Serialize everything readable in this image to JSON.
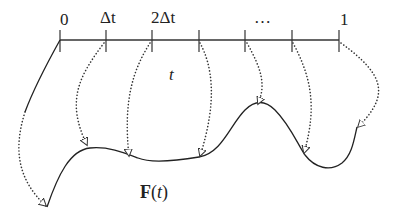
{
  "diagram": {
    "type": "parameter-interval-to-curve mapping",
    "axis": {
      "tick_labels": [
        "0",
        "Δt",
        "2Δt",
        "…",
        "1"
      ],
      "variable_label": "t",
      "tick_count": 7
    },
    "curve_label": {
      "function": "F",
      "open_paren": "(",
      "arg": "t",
      "close_paren": ")"
    },
    "colors": {
      "stroke": "#333333",
      "background": "#ffffff"
    }
  }
}
